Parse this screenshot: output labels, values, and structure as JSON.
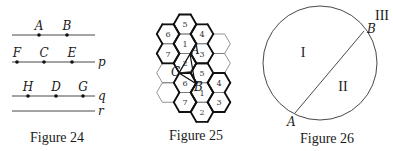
{
  "figures": [
    {
      "caption": "Figure 24",
      "lines": [
        {
          "name": "",
          "y": 35,
          "points": [
            {
              "label": "A",
              "x": 39
            },
            {
              "label": "B",
              "x": 67
            }
          ]
        },
        {
          "name": "p",
          "y": 62,
          "points": [
            {
              "label": "F",
              "x": 17
            },
            {
              "label": "C",
              "x": 44
            },
            {
              "label": "E",
              "x": 72
            }
          ]
        },
        {
          "name": "q",
          "y": 96,
          "points": [
            {
              "label": "H",
              "x": 28
            },
            {
              "label": "D",
              "x": 56
            },
            {
              "label": "G",
              "x": 83
            }
          ]
        },
        {
          "name": "r",
          "y": 111,
          "points": []
        }
      ]
    },
    {
      "caption": "Figure 25",
      "hex_columns": [
        {
          "x": 168,
          "cells": [
            {
              "y": 34,
              "label": "6"
            },
            {
              "y": 53.5,
              "label": "7"
            },
            {
              "y": 73,
              "label": ""
            },
            {
              "y": 92.5,
              "label": ""
            }
          ]
        },
        {
          "x": 185,
          "cells": [
            {
              "y": 24.25,
              "label": "5"
            },
            {
              "y": 43.75,
              "label": "1"
            },
            {
              "y": 63.25,
              "label": "2"
            },
            {
              "y": 82.75,
              "label": "6"
            },
            {
              "y": 102.25,
              "label": "7"
            }
          ]
        },
        {
          "x": 202,
          "cells": [
            {
              "y": 34,
              "label": "4"
            },
            {
              "y": 53.5,
              "label": "3"
            },
            {
              "y": 73,
              "label": "5"
            },
            {
              "y": 92.5,
              "label": "1"
            },
            {
              "y": 112,
              "label": "2"
            }
          ]
        },
        {
          "x": 219,
          "cells": [
            {
              "y": 43.75,
              "label": ""
            },
            {
              "y": 63.25,
              "label": ""
            },
            {
              "y": 82.75,
              "label": "4"
            },
            {
              "y": 102.25,
              "label": "3"
            }
          ]
        }
      ],
      "triangle": {
        "A": {
          "label": "A",
          "x": 190,
          "y": 54
        },
        "B": {
          "label": "B",
          "x": 195,
          "y": 83
        },
        "C": {
          "label": "C",
          "x": 179,
          "y": 73
        }
      }
    },
    {
      "caption": "Figure 26",
      "circle": {
        "cx": 320,
        "cy": 63,
        "r": 57
      },
      "chord": {
        "A": {
          "label": "A",
          "x": 295,
          "y": 113
        },
        "B": {
          "label": "B",
          "x": 364,
          "y": 31
        }
      },
      "regions": [
        "I",
        "II",
        "III"
      ]
    }
  ]
}
